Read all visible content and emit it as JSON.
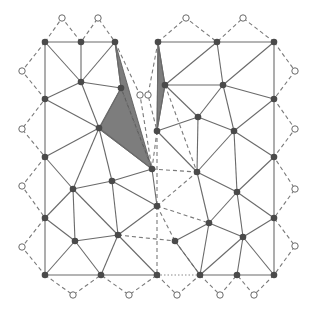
{
  "diagram": {
    "type": "mesh-triangulation",
    "colors": {
      "edge": "#6a6a6a",
      "node": "#4a4a4a",
      "shade": "#7d7d7d",
      "ghost_fill": "#ffffff"
    },
    "nodes": [
      {
        "id": "L1",
        "x": 45,
        "y": 42
      },
      {
        "id": "L2",
        "x": 81,
        "y": 42
      },
      {
        "id": "L3",
        "x": 115,
        "y": 42
      },
      {
        "id": "L4",
        "x": 81,
        "y": 82
      },
      {
        "id": "L5",
        "x": 121,
        "y": 88
      },
      {
        "id": "L6",
        "x": 45,
        "y": 99
      },
      {
        "id": "L7",
        "x": 99,
        "y": 128
      },
      {
        "id": "L8",
        "x": 45,
        "y": 157
      },
      {
        "id": "L9",
        "x": 152,
        "y": 169
      },
      {
        "id": "L10",
        "x": 112,
        "y": 181
      },
      {
        "id": "L11",
        "x": 73,
        "y": 189
      },
      {
        "id": "L12",
        "x": 157,
        "y": 206
      },
      {
        "id": "L13",
        "x": 45,
        "y": 218
      },
      {
        "id": "L14",
        "x": 118,
        "y": 235
      },
      {
        "id": "L15",
        "x": 75,
        "y": 241
      },
      {
        "id": "L16",
        "x": 45,
        "y": 275
      },
      {
        "id": "L17",
        "x": 101,
        "y": 275
      },
      {
        "id": "L18",
        "x": 157,
        "y": 275
      },
      {
        "id": "R1",
        "x": 158,
        "y": 42
      },
      {
        "id": "R2",
        "x": 217,
        "y": 42
      },
      {
        "id": "R3",
        "x": 274,
        "y": 42
      },
      {
        "id": "R4",
        "x": 165,
        "y": 85
      },
      {
        "id": "R5",
        "x": 223,
        "y": 85
      },
      {
        "id": "R6",
        "x": 274,
        "y": 99
      },
      {
        "id": "R7",
        "x": 198,
        "y": 117
      },
      {
        "id": "R8",
        "x": 157,
        "y": 131
      },
      {
        "id": "R9",
        "x": 234,
        "y": 131
      },
      {
        "id": "R10",
        "x": 274,
        "y": 157
      },
      {
        "id": "R11",
        "x": 197,
        "y": 172
      },
      {
        "id": "R12",
        "x": 237,
        "y": 192
      },
      {
        "id": "R13",
        "x": 274,
        "y": 218
      },
      {
        "id": "R14",
        "x": 209,
        "y": 223
      },
      {
        "id": "R15",
        "x": 243,
        "y": 237
      },
      {
        "id": "R16",
        "x": 175,
        "y": 241
      },
      {
        "id": "R17",
        "x": 200,
        "y": 275
      },
      {
        "id": "R18",
        "x": 237,
        "y": 275
      },
      {
        "id": "R19",
        "x": 274,
        "y": 275
      }
    ],
    "ghost_points": [
      {
        "x": 62,
        "y": 18
      },
      {
        "x": 98,
        "y": 18
      },
      {
        "x": 186,
        "y": 18
      },
      {
        "x": 243,
        "y": 18
      },
      {
        "x": 22,
        "y": 71
      },
      {
        "x": 22,
        "y": 129
      },
      {
        "x": 22,
        "y": 186
      },
      {
        "x": 22,
        "y": 247
      },
      {
        "x": 295,
        "y": 71
      },
      {
        "x": 295,
        "y": 129
      },
      {
        "x": 295,
        "y": 189
      },
      {
        "x": 295,
        "y": 246
      },
      {
        "x": 73,
        "y": 295
      },
      {
        "x": 129,
        "y": 295
      },
      {
        "x": 177,
        "y": 295
      },
      {
        "x": 220,
        "y": 295
      },
      {
        "x": 254,
        "y": 295
      },
      {
        "x": 140,
        "y": 95
      },
      {
        "x": 148,
        "y": 95
      }
    ],
    "shaded_triangles": [
      [
        [
          115,
          42
        ],
        [
          121,
          88
        ],
        [
          152,
          169
        ]
      ],
      [
        [
          121,
          88
        ],
        [
          99,
          129
        ],
        [
          152,
          169
        ]
      ],
      [
        [
          158,
          42
        ],
        [
          165,
          85
        ],
        [
          157,
          131
        ]
      ]
    ]
  }
}
